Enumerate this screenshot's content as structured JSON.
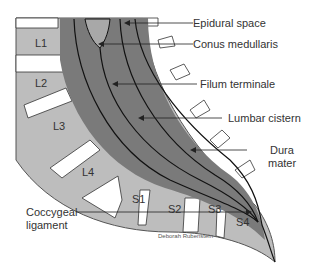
{
  "diagram": {
    "labels": {
      "epidural_space": "Epidural space",
      "conus_medullaris": "Conus medullaris",
      "filum_terminale": "Filum terminale",
      "lumbar_cistern": "Lumbar cistern",
      "dura_mater_line1": "Dura",
      "dura_mater_line2": "mater",
      "coccygeal_line1": "Coccygeal",
      "coccygeal_line2": "ligament"
    },
    "vertebrae": [
      "L1",
      "L2",
      "L3",
      "L4",
      "S1",
      "S2",
      "S3",
      "S4"
    ],
    "credit": "Deborah Rubenstein",
    "colors": {
      "vertebra": "#bdbdbd",
      "dural_sac": "#7a7a7a",
      "conus": "#a8a8a8",
      "outline": "#555555",
      "lines": "#111111"
    }
  }
}
